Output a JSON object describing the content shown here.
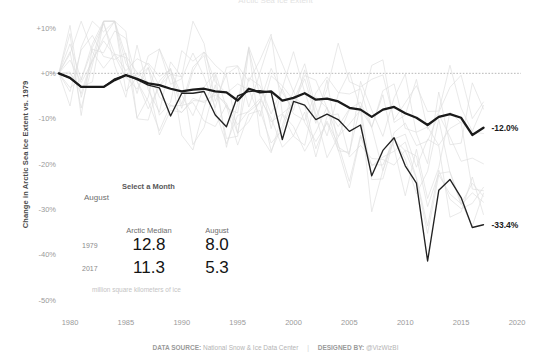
{
  "title": "Arctic Sea Ice Extent",
  "yaxis": {
    "title": "Change in Arctic Sea Ice Extent vs. 1979",
    "ticks": [
      "+10%",
      "+0%",
      "-10%",
      "-20%",
      "-30%",
      "-40%",
      "-50%"
    ],
    "tick_values": [
      10,
      0,
      -10,
      -20,
      -30,
      -40,
      -50
    ],
    "min": -52,
    "max": 12
  },
  "xaxis": {
    "ticks": [
      "1980",
      "1985",
      "1990",
      "1995",
      "2000",
      "2005",
      "2010",
      "2015",
      "2020"
    ],
    "tick_values": [
      1980,
      1985,
      1990,
      1995,
      2000,
      2005,
      2010,
      2015,
      2020
    ],
    "min": 1978.2,
    "max": 2020.8
  },
  "endpoint_labels": {
    "median": "-12.0%",
    "month": "-33.4%"
  },
  "legend": {
    "select_title": "Select a Month",
    "selected_month": "August",
    "columns": [
      "Arctic Median",
      "August"
    ],
    "rows": [
      {
        "year": "1979",
        "median": "12.8",
        "month": "8.0"
      },
      {
        "year": "2017",
        "median": "11.3",
        "month": "5.3"
      }
    ],
    "footnote": "million square kilometers of ice"
  },
  "footer": {
    "source_label": "DATA SOURCE:",
    "source_value": "National Snow & Ice Data Center",
    "separator": "|",
    "designer_label": "DESIGNED BY:",
    "designer_value": "@VizWizBI"
  },
  "colors": {
    "median_line": "#1a1a1a",
    "month_line": "#222222",
    "background_line": "#dcdcdc",
    "zero_line": "#9a9a9a",
    "tick_text": "#9a9a9a",
    "axis_title": "#4a4a4a"
  },
  "chart_data": {
    "type": "line",
    "title": "Change in Arctic Sea Ice Extent vs. 1979",
    "xlabel": "",
    "ylabel": "Change in Arctic Sea Ice Extent vs. 1979",
    "xlim": [
      1978.2,
      2020.8
    ],
    "ylim": [
      -52,
      12
    ],
    "grid": false,
    "legend_position": "inline-right-endpoints",
    "x": [
      1979,
      1980,
      1981,
      1982,
      1983,
      1984,
      1985,
      1986,
      1987,
      1988,
      1989,
      1990,
      1991,
      1992,
      1993,
      1994,
      1995,
      1996,
      1997,
      1998,
      1999,
      2000,
      2001,
      2002,
      2003,
      2004,
      2005,
      2006,
      2007,
      2008,
      2009,
      2010,
      2011,
      2012,
      2013,
      2014,
      2015,
      2016,
      2017
    ],
    "series": [
      {
        "name": "Arctic Median",
        "emphasis": "primary",
        "color": "#1a1a1a",
        "end_label": "-12.0%",
        "values": [
          0.0,
          -1.0,
          -3.0,
          -3.0,
          -3.0,
          -1.5,
          -0.4,
          -1.2,
          -2.2,
          -2.6,
          -3.4,
          -4.0,
          -3.6,
          -3.4,
          -4.0,
          -4.2,
          -6.0,
          -3.4,
          -4.2,
          -4.0,
          -6.0,
          -5.4,
          -4.4,
          -5.8,
          -5.6,
          -6.2,
          -7.6,
          -8.0,
          -9.6,
          -8.0,
          -7.4,
          -8.8,
          -9.8,
          -11.4,
          -9.6,
          -9.0,
          -9.8,
          -13.6,
          -12.0
        ]
      },
      {
        "name": "August",
        "emphasis": "secondary",
        "color": "#222222",
        "end_label": "-33.4%",
        "values": [
          0.0,
          -1.0,
          -3.0,
          -3.0,
          -3.0,
          -1.2,
          -0.4,
          -1.4,
          -2.6,
          -3.2,
          -9.4,
          -4.4,
          -4.4,
          -4.0,
          -9.2,
          -11.8,
          -5.0,
          -4.0,
          -3.8,
          -4.2,
          -14.6,
          -6.2,
          -7.0,
          -10.2,
          -9.0,
          -10.2,
          -12.8,
          -11.4,
          -22.6,
          -17.0,
          -14.2,
          -20.4,
          -24.2,
          -41.4,
          -25.8,
          -23.4,
          -27.4,
          -34.0,
          -33.4
        ]
      },
      {
        "name": "Other months (background)",
        "emphasis": "background",
        "color": "#dcdcdc",
        "values": [
          0,
          2,
          -1,
          4,
          7,
          9,
          2,
          -2,
          -3,
          -4,
          -3,
          -5,
          -4,
          -3,
          -5,
          -6,
          -7,
          -4,
          -5,
          -6,
          -8,
          -7,
          -6,
          -9,
          -8,
          -9,
          -11,
          -10,
          -14,
          -12,
          -11,
          -13,
          -15,
          -20,
          -16,
          -15,
          -17,
          -20,
          -19
        ]
      }
    ],
    "annotations": [
      {
        "text": "-12.0%",
        "x": 2017,
        "y": -12.0
      },
      {
        "text": "-33.4%",
        "x": 2017,
        "y": -33.4
      }
    ],
    "callout_table": {
      "columns": [
        "",
        "Arctic Median",
        "August"
      ],
      "rows": [
        [
          "1979",
          12.8,
          8.0
        ],
        [
          "2017",
          11.3,
          5.3
        ]
      ],
      "units": "million square kilometers of ice"
    }
  }
}
